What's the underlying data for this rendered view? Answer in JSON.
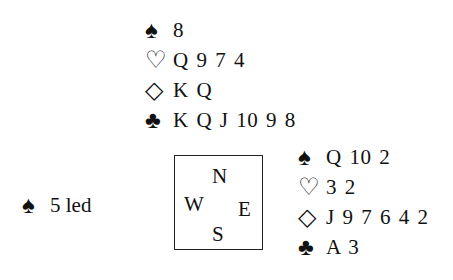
{
  "north": {
    "rows": [
      {
        "suit_icon": "spade-icon",
        "glyph": "♠",
        "cards": "8"
      },
      {
        "suit_icon": "heart-icon",
        "glyph": "♡",
        "cards": "Q 9 7 4"
      },
      {
        "suit_icon": "diamond-icon",
        "glyph": "◇",
        "cards": "K Q"
      },
      {
        "suit_icon": "club-icon",
        "glyph": "♣",
        "cards": "K Q J 10 9 8"
      }
    ]
  },
  "east": {
    "rows": [
      {
        "suit_icon": "spade-icon",
        "glyph": "♠",
        "cards": "Q 10 2"
      },
      {
        "suit_icon": "heart-icon",
        "glyph": "♡",
        "cards": "3 2"
      },
      {
        "suit_icon": "diamond-icon",
        "glyph": "◇",
        "cards": "J 9 7 6 4 2"
      },
      {
        "suit_icon": "club-icon",
        "glyph": "♣",
        "cards": "A 3"
      }
    ]
  },
  "opening_lead": {
    "glyph": "♠",
    "suit_icon": "spade-icon",
    "text": "5 led"
  },
  "compass": {
    "n": "N",
    "w": "W",
    "e": "E",
    "s": "S"
  }
}
